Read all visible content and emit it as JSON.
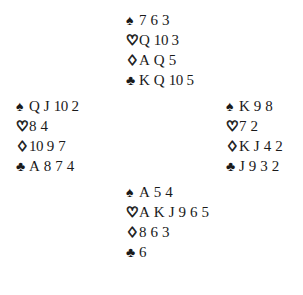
{
  "diagram": {
    "type": "bridge-hand-diagram",
    "ink_color": "#1a1a1a",
    "background_color": "#ffffff",
    "suits": [
      {
        "key": "spades",
        "symbol": "♠",
        "name": "spade-pip",
        "style": "filled"
      },
      {
        "key": "hearts",
        "symbol": "♡",
        "name": "heart-pip",
        "style": "hollow"
      },
      {
        "key": "diamonds",
        "symbol": "♢",
        "name": "diamond-pip",
        "style": "hollow"
      },
      {
        "key": "clubs",
        "symbol": "♣",
        "name": "club-pip",
        "style": "filled"
      }
    ],
    "hands": {
      "north": {
        "position": "North",
        "spades": [
          "7",
          "6",
          "3"
        ],
        "hearts": [
          "Q",
          "10",
          "3"
        ],
        "diamonds": [
          "A",
          "Q",
          "5"
        ],
        "clubs": [
          "K",
          "Q",
          "10",
          "5"
        ]
      },
      "west": {
        "position": "West",
        "spades": [
          "Q",
          "J",
          "10",
          "2"
        ],
        "hearts": [
          "8",
          "4"
        ],
        "diamonds": [
          "10",
          "9",
          "7"
        ],
        "clubs": [
          "A",
          "8",
          "7",
          "4"
        ]
      },
      "east": {
        "position": "East",
        "spades": [
          "K",
          "9",
          "8"
        ],
        "hearts": [
          "7",
          "2"
        ],
        "diamonds": [
          "K",
          "J",
          "4",
          "2"
        ],
        "clubs": [
          "J",
          "9",
          "3",
          "2"
        ]
      },
      "south": {
        "position": "South",
        "spades": [
          "A",
          "5",
          "4"
        ],
        "hearts": [
          "A",
          "K",
          "J",
          "9",
          "6",
          "5"
        ],
        "diamonds": [
          "8",
          "6",
          "3"
        ],
        "clubs": [
          "6"
        ]
      }
    }
  }
}
